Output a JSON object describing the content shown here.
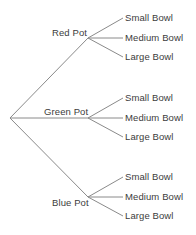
{
  "diagram": {
    "type": "probability-tree",
    "title": "",
    "root": {
      "label": "",
      "x": 10,
      "y": 118
    },
    "stage1": {
      "name": "Pot",
      "nodes": [
        {
          "label": "Red Pot",
          "x": 88,
          "y": 38,
          "label_x": 52,
          "label_y": 28,
          "color": "#3c3c3c"
        },
        {
          "label": "Green Pot",
          "x": 88,
          "y": 118,
          "label_x": 44,
          "label_y": 107,
          "color": "#3c3c3c"
        },
        {
          "label": "Blue Pot",
          "x": 88,
          "y": 197,
          "label_x": 52,
          "label_y": 198,
          "color": "#3c3c3c"
        }
      ]
    },
    "stage2": {
      "name": "Bowl",
      "branch_labels": [
        "Small Bowl",
        "Medium Bowl",
        "Large Bowl"
      ],
      "groups": [
        {
          "parent": "Red Pot",
          "leaves": [
            {
              "label": "Small Bowl",
              "line_x1": 88,
              "line_y1": 38,
              "line_x2": 123,
              "line_y2": 18,
              "text_x": 125,
              "text_y": 13
            },
            {
              "label": "Medium Bowl",
              "line_x1": 88,
              "line_y1": 38,
              "line_x2": 123,
              "line_y2": 38,
              "text_x": 125,
              "text_y": 33
            },
            {
              "label": "Large Bowl",
              "line_x1": 88,
              "line_y1": 38,
              "line_x2": 123,
              "line_y2": 57,
              "text_x": 125,
              "text_y": 52
            }
          ]
        },
        {
          "parent": "Green Pot",
          "leaves": [
            {
              "label": "Small Bowl",
              "line_x1": 88,
              "line_y1": 118,
              "line_x2": 123,
              "line_y2": 98,
              "text_x": 125,
              "text_y": 93
            },
            {
              "label": "Medium Bowl",
              "line_x1": 88,
              "line_y1": 118,
              "line_x2": 123,
              "line_y2": 118,
              "text_x": 125,
              "text_y": 113
            },
            {
              "label": "Large Bowl",
              "line_x1": 88,
              "line_y1": 118,
              "line_x2": 123,
              "line_y2": 137,
              "text_x": 125,
              "text_y": 132
            }
          ]
        },
        {
          "parent": "Blue Pot",
          "leaves": [
            {
              "label": "Small Bowl",
              "line_x1": 88,
              "line_y1": 197,
              "line_x2": 123,
              "line_y2": 177,
              "text_x": 125,
              "text_y": 172
            },
            {
              "label": "Medium Bowl",
              "line_x1": 88,
              "line_y1": 197,
              "line_x2": 123,
              "line_y2": 197,
              "text_x": 125,
              "text_y": 192
            },
            {
              "label": "Large Bowl",
              "line_x1": 88,
              "line_y1": 197,
              "line_x2": 123,
              "line_y2": 216,
              "text_x": 125,
              "text_y": 211
            }
          ]
        }
      ]
    },
    "style": {
      "background": "#ffffff",
      "line_color": "#8a8a8a",
      "text_color": "#3c3c3c"
    }
  }
}
